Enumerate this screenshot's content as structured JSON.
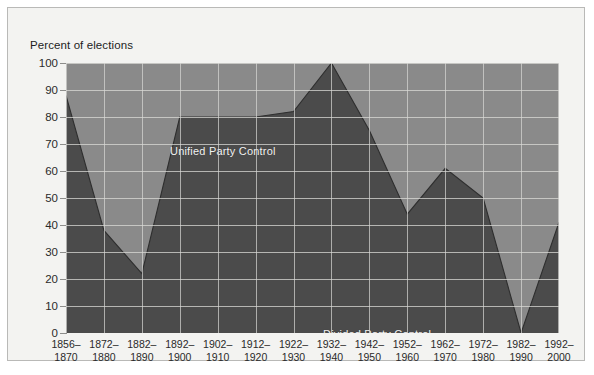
{
  "figure": {
    "axis_title": "Percent of elections",
    "unified_label": "Unified Party Control",
    "divided_label": "Divided Party Control"
  },
  "chart_data": {
    "type": "area",
    "title": "",
    "subtitle": "",
    "xlabel": "",
    "ylabel": "Percent of elections",
    "ylim": [
      0,
      100
    ],
    "xlim": [
      0,
      13
    ],
    "ytick_values": [
      0,
      10,
      20,
      30,
      40,
      50,
      60,
      70,
      80,
      90,
      100
    ],
    "ytick_labels": [
      "0",
      "10",
      "20",
      "30",
      "40",
      "50",
      "60",
      "70",
      "80",
      "90",
      "100"
    ],
    "grid": true,
    "legend_position": "inline-annotations",
    "categories": [
      "1856–\n1870",
      "1872–\n1880",
      "1882–\n1890",
      "1892–\n1900",
      "1902–\n1910",
      "1912–\n1920",
      "1922–\n1930",
      "1932–\n1940",
      "1942–\n1950",
      "1952–\n1960",
      "1962–\n1970",
      "1972–\n1980",
      "1982–\n1990",
      "1992–\n2000"
    ],
    "categories_line1": [
      "1856–",
      "1872–",
      "1882–",
      "1892–",
      "1902–",
      "1912–",
      "1922–",
      "1932–",
      "1942–",
      "1952–",
      "1962–",
      "1972–",
      "1982–",
      "1992–"
    ],
    "categories_line2": [
      "1870",
      "1880",
      "1890",
      "1900",
      "1910",
      "1920",
      "1930",
      "1940",
      "1950",
      "1960",
      "1970",
      "1980",
      "1990",
      "2000"
    ],
    "series": [
      {
        "name": "Divided Party Control",
        "values": [
          88,
          38,
          22,
          80,
          80,
          80,
          82,
          100,
          75,
          44,
          61,
          50,
          0,
          41
        ],
        "color": "#4b4b4b"
      },
      {
        "name": "Unified Party Control",
        "values": [
          12,
          62,
          78,
          20,
          20,
          20,
          18,
          0,
          25,
          56,
          39,
          50,
          100,
          59
        ],
        "color": "#8a8a8a"
      }
    ],
    "annotations": [
      {
        "text": "Unified Party Control",
        "x_index": 1.3,
        "y": 91
      },
      {
        "text": "Divided Party Control",
        "x_index": 6.4,
        "y": 19
      }
    ],
    "colors": {
      "divided_area": "#4b4b4b",
      "unified_area": "#8a8a8a",
      "gridline": "#d9d9d6",
      "background": "#f3f3f1",
      "frame": "#b9b9b7",
      "text": "#2a2a2a",
      "annotation_text": "#f2f2f2"
    }
  }
}
